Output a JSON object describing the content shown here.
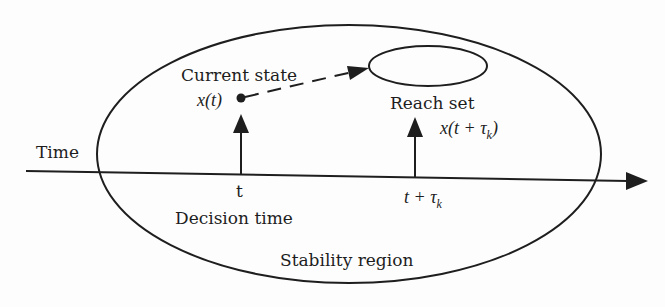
{
  "diagram": {
    "colors": {
      "stroke": "#1e1e1e",
      "background": "#fdfdfd"
    },
    "labels": {
      "current_state": "Current state",
      "x_t": "x(t)",
      "reach_set": "Reach set",
      "x_t_tau_prefix": "x(t + τ",
      "x_t_tau_sub": "k",
      "x_t_tau_suffix": ")",
      "time": "Time",
      "t": "t",
      "decision_time": "Decision time",
      "t_tau_prefix": "t + τ",
      "t_tau_sub": "k",
      "stability_region": "Stability region"
    },
    "shapes": {
      "stability_region_ellipse": {
        "cx": 349,
        "cy": 154,
        "rx": 252,
        "ry": 129
      },
      "reach_set_ellipse": {
        "cx": 428,
        "cy": 66,
        "rx": 59,
        "ry": 20
      },
      "time_axis": {
        "x1": 26,
        "y1": 171,
        "x2": 648,
        "y2": 181
      },
      "current_state_point": {
        "cx": 241,
        "cy": 98
      },
      "decision_arrow": {
        "x": 241,
        "y_base": 174,
        "y_tip": 114
      },
      "reach_arrow": {
        "x": 415,
        "y_base": 178,
        "y_tip": 117
      },
      "transition_arrow": {
        "x1": 241,
        "y1": 98,
        "x2": 369,
        "y2": 68,
        "style": "dashed"
      }
    }
  }
}
